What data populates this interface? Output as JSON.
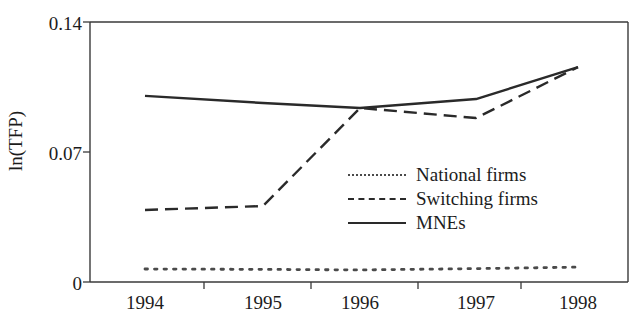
{
  "chart_data": {
    "type": "line",
    "title": "",
    "xlabel": "",
    "ylabel": "ln(TFP)",
    "x": [
      1994,
      1995,
      1996,
      1997,
      1998
    ],
    "xticklabels": [
      "1994",
      "1995",
      "1996",
      "1997",
      "1998"
    ],
    "yticks": [
      0,
      0.07,
      0.14
    ],
    "yticklabels": [
      "0",
      "0.07",
      "0.14"
    ],
    "ylim": [
      0,
      0.14
    ],
    "grid": false,
    "legend_position": "center-right",
    "series": [
      {
        "name": "National firms",
        "style": "dotted",
        "color": "#4a4a4a",
        "values": [
          0.007,
          0.0068,
          0.0065,
          0.0072,
          0.008
        ]
      },
      {
        "name": "Switching firms",
        "style": "dashed",
        "color": "#2a2a2a",
        "values": [
          0.0388,
          0.0409,
          0.0937,
          0.0883,
          0.1157
        ]
      },
      {
        "name": "MNEs",
        "style": "solid",
        "color": "#2a2a2a",
        "values": [
          0.1002,
          0.0964,
          0.0937,
          0.0985,
          0.1157
        ]
      }
    ]
  },
  "axis": {
    "y_title": "ln(TFP)"
  },
  "legend": {
    "items": [
      {
        "label": "National firms",
        "style": "dotted"
      },
      {
        "label": "Switching firms",
        "style": "dashed"
      },
      {
        "label": "MNEs",
        "style": "solid"
      }
    ]
  }
}
